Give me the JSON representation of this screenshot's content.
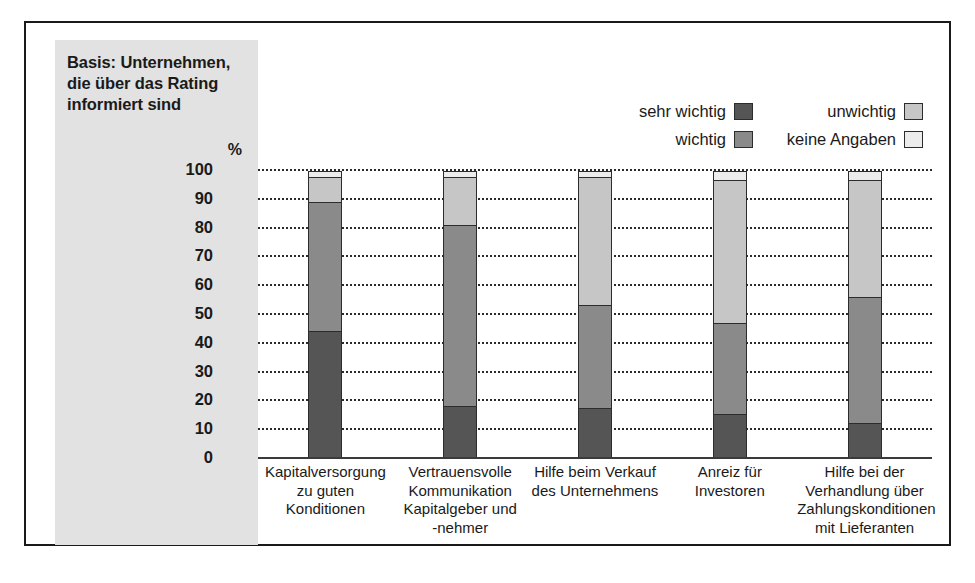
{
  "basis": {
    "lines": [
      "Basis: Unternehmen,",
      "die über das Rating",
      "informiert sind"
    ],
    "unit": "%"
  },
  "legend": {
    "items": [
      {
        "label": "sehr wichtig",
        "color": "#555555"
      },
      {
        "label": "wichtig",
        "color": "#8a8a8a"
      },
      {
        "label": "unwichtig",
        "color": "#c6c6c6"
      },
      {
        "label": "keine Angaben",
        "color": "#ececec"
      }
    ]
  },
  "chart_data": {
    "type": "bar",
    "stacked": true,
    "title": "",
    "xlabel": "",
    "ylabel": "%",
    "ylim": [
      0,
      100
    ],
    "yticks": [
      100,
      90,
      80,
      70,
      60,
      50,
      40,
      30,
      20,
      10,
      0
    ],
    "grid": true,
    "legend_position": "top-right",
    "categories": [
      "Kapitalversorgung\nzu guten\nKonditionen",
      "Vertrauensvolle\nKommunikation\nKapitalgeber und\n-nehmer",
      "Hilfe beim Verkauf\ndes Unternehmens",
      "Anreiz für\nInvestoren",
      "Hilfe bei der\nVerhandlung über\nZahlungskonditionen\nmit Lieferanten"
    ],
    "category_lines": [
      [
        "Kapitalversorgung",
        "zu guten",
        "Konditionen"
      ],
      [
        "Vertrauensvolle",
        "Kommunikation",
        "Kapitalgeber und",
        "-nehmer"
      ],
      [
        "Hilfe beim Verkauf",
        "des Unternehmens"
      ],
      [
        "Anreiz für",
        "Investoren"
      ],
      [
        "Hilfe bei der",
        "Verhandlung über",
        "Zahlungskonditionen",
        "mit Lieferanten"
      ]
    ],
    "series": [
      {
        "name": "sehr wichtig",
        "color": "#555555",
        "values": [
          44,
          18,
          17,
          15,
          12
        ]
      },
      {
        "name": "wichtig",
        "color": "#8a8a8a",
        "values": [
          45,
          63,
          36,
          32,
          44
        ]
      },
      {
        "name": "unwichtig",
        "color": "#c6c6c6",
        "values": [
          9,
          17,
          45,
          50,
          41
        ]
      },
      {
        "name": "keine Angaben",
        "color": "#ececec",
        "values": [
          2,
          2,
          2,
          3,
          3
        ]
      }
    ]
  }
}
